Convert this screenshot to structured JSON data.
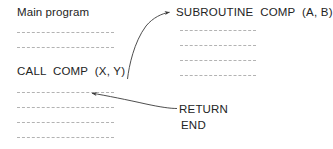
{
  "diagram": {
    "type": "control-flow",
    "title_visible": false,
    "colors": {
      "text": "#242424",
      "dash_line": "#b3b3b3",
      "arrow": "#3a3a3a",
      "background": "#ffffff"
    },
    "main_program": {
      "heading": "Main program",
      "call_statement": "CALL  COMP  (X, Y)",
      "code_lines_above_call": 2,
      "code_lines_below_call": 4
    },
    "subroutine": {
      "heading": "SUBROUTINE  COMP  (A, B)",
      "return_statement": "RETURN",
      "end_statement": "END",
      "code_lines": 4
    },
    "arrows": [
      {
        "name": "call-arrow",
        "from": "CALL  COMP  (X, Y)",
        "to": "SUBROUTINE  COMP  (A, B)",
        "direction": "up-right"
      },
      {
        "name": "return-arrow",
        "from": "RETURN",
        "to": "line after CALL  COMP  (X, Y)",
        "direction": "left"
      }
    ]
  }
}
